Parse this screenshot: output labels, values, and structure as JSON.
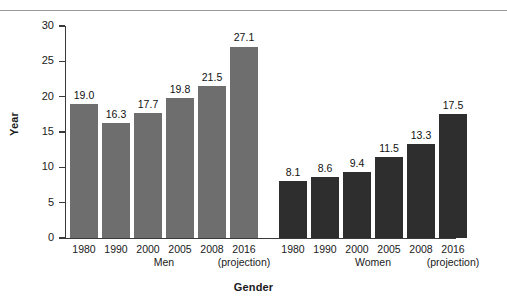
{
  "chart_data": {
    "type": "bar",
    "title": "",
    "xlabel": "Gender",
    "ylabel": "Year",
    "ylim": [
      0,
      30
    ],
    "ytick_labels": [
      "0",
      "5",
      "10",
      "15",
      "20",
      "25",
      "30"
    ],
    "yticks": [
      0,
      5,
      10,
      15,
      20,
      25,
      30
    ],
    "grid": false,
    "legend": "none",
    "categories": [
      "1980",
      "1990",
      "2000",
      "2005",
      "2008",
      "2016"
    ],
    "category_sublabels": [
      "",
      "",
      "",
      "",
      "",
      "(projection)"
    ],
    "groups": [
      {
        "name": "Men",
        "color": "#6e6e6e",
        "values": [
          19.0,
          16.3,
          17.7,
          19.8,
          21.5,
          27.1
        ],
        "value_labels": [
          "19.0",
          "16.3",
          "17.7",
          "19.8",
          "21.5",
          "27.1"
        ]
      },
      {
        "name": "Women",
        "color": "#2e2e2e",
        "values": [
          8.1,
          8.6,
          9.4,
          11.5,
          13.3,
          17.5
        ],
        "value_labels": [
          "8.1",
          "8.6",
          "9.4",
          "11.5",
          "13.3",
          "17.5"
        ]
      }
    ]
  },
  "axis": {
    "y_title": "Year",
    "x_title": "Gender"
  },
  "colors": {
    "background": "#ffffff",
    "axis": "#3a3a3a",
    "rule": "#9a9a9a",
    "men_bar": "#6e6e6e",
    "women_bar": "#2e2e2e",
    "text": "#1a1a1a"
  }
}
